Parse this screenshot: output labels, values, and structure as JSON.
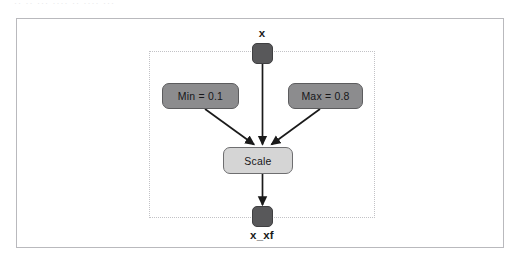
{
  "figure": {
    "artifact_text": "·· ·· ··· ···· ·· ···· ···",
    "frame_name": "figure-frame",
    "subsystem_name": "scale-subsystem"
  },
  "nodes": {
    "input_port": {
      "label": "x",
      "shape": "rounded-square",
      "color": "#58585a"
    },
    "output_port": {
      "label": "x_xf",
      "shape": "rounded-square",
      "color": "#58585a"
    },
    "min_const": {
      "label": "Min = 0.1",
      "shape": "rounded-rect",
      "color": "#8c8c8e"
    },
    "max_const": {
      "label": "Max = 0.8",
      "shape": "rounded-rect",
      "color": "#8c8c8e"
    },
    "operation": {
      "label": "Scale",
      "shape": "rounded-rect",
      "color": "#d5d5d5"
    }
  },
  "edges": [
    {
      "name": "x-to-scale",
      "from": "x",
      "to": "Scale",
      "arrow": true
    },
    {
      "name": "min-to-scale",
      "from": "Min = 0.1",
      "to": "Scale",
      "arrow": true
    },
    {
      "name": "max-to-scale",
      "from": "Max = 0.8",
      "to": "Scale",
      "arrow": true
    },
    {
      "name": "scale-to-xxf",
      "from": "Scale",
      "to": "x_xf",
      "arrow": true
    }
  ],
  "colors": {
    "edge": "#1a1a1a",
    "frame_border": "#b9b9bd",
    "boundary_border": "#c2c2c6",
    "background": "#ffffff"
  }
}
